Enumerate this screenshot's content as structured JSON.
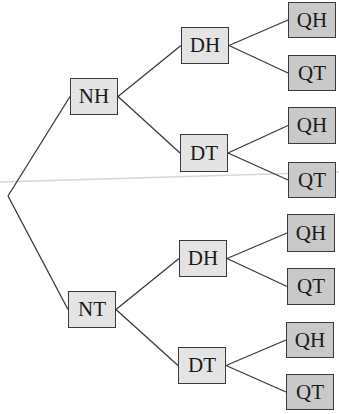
{
  "diagram": {
    "type": "tree",
    "colors": {
      "line": "#3a3a3a",
      "level1_fill": "#e4e4e4",
      "level2_fill": "#e4e4e4",
      "level3_fill": "#c9c9c9",
      "scan_line": "#d6d6d6"
    },
    "root": {
      "x": 8,
      "y": 196
    },
    "nodes": [
      {
        "id": "n1",
        "label": "NH",
        "level": 1,
        "x": 70,
        "y": 78,
        "w": 48,
        "h": 37,
        "parent": "root"
      },
      {
        "id": "n2",
        "label": "NT",
        "level": 1,
        "x": 68,
        "y": 291,
        "w": 48,
        "h": 37,
        "parent": "root"
      },
      {
        "id": "n3",
        "label": "DH",
        "level": 2,
        "x": 181,
        "y": 27,
        "w": 48,
        "h": 37,
        "parent": "n1"
      },
      {
        "id": "n4",
        "label": "DT",
        "level": 2,
        "x": 180,
        "y": 134,
        "w": 48,
        "h": 38,
        "parent": "n1"
      },
      {
        "id": "n5",
        "label": "DH",
        "level": 2,
        "x": 179,
        "y": 240,
        "w": 48,
        "h": 37,
        "parent": "n2"
      },
      {
        "id": "n6",
        "label": "DT",
        "level": 2,
        "x": 178,
        "y": 347,
        "w": 48,
        "h": 37,
        "parent": "n2"
      },
      {
        "id": "n7",
        "label": "QH",
        "level": 3,
        "x": 288,
        "y": 2,
        "w": 48,
        "h": 36,
        "parent": "n3"
      },
      {
        "id": "n8",
        "label": "QT",
        "level": 3,
        "x": 288,
        "y": 55,
        "w": 48,
        "h": 36,
        "parent": "n3"
      },
      {
        "id": "n9",
        "label": "QH",
        "level": 3,
        "x": 288,
        "y": 107,
        "w": 48,
        "h": 37,
        "parent": "n4"
      },
      {
        "id": "n10",
        "label": "QT",
        "level": 3,
        "x": 288,
        "y": 162,
        "w": 48,
        "h": 36,
        "parent": "n4"
      },
      {
        "id": "n11",
        "label": "QH",
        "level": 3,
        "x": 287,
        "y": 214,
        "w": 48,
        "h": 38,
        "parent": "n5"
      },
      {
        "id": "n12",
        "label": "QT",
        "level": 3,
        "x": 287,
        "y": 268,
        "w": 48,
        "h": 37,
        "parent": "n5"
      },
      {
        "id": "n13",
        "label": "QH",
        "level": 3,
        "x": 286,
        "y": 322,
        "w": 48,
        "h": 36,
        "parent": "n6"
      },
      {
        "id": "n14",
        "label": "QT",
        "level": 3,
        "x": 286,
        "y": 374,
        "w": 48,
        "h": 36,
        "parent": "n6"
      }
    ]
  }
}
